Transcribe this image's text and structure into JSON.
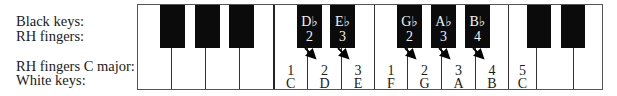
{
  "labels": {
    "black_keys": "Black keys:",
    "rh_fingers": "RH fingers:",
    "rh_fingers_c_major": "RH fingers C major:",
    "white_keys": "White keys:"
  },
  "white_keys": [
    {
      "note": "",
      "finger": ""
    },
    {
      "note": "",
      "finger": ""
    },
    {
      "note": "",
      "finger": ""
    },
    {
      "note": "",
      "finger": ""
    },
    {
      "note": "C",
      "finger": "1"
    },
    {
      "note": "D",
      "finger": "2"
    },
    {
      "note": "E",
      "finger": "3"
    },
    {
      "note": "F",
      "finger": "1"
    },
    {
      "note": "G",
      "finger": "2"
    },
    {
      "note": "A",
      "finger": "3"
    },
    {
      "note": "B",
      "finger": "4"
    },
    {
      "note": "C",
      "finger": "5"
    },
    {
      "note": "",
      "finger": ""
    },
    {
      "note": "",
      "finger": ""
    }
  ],
  "black_keys": [
    {
      "name": "",
      "finger": ""
    },
    {
      "name": "",
      "finger": ""
    },
    {
      "name": "",
      "finger": ""
    },
    {
      "name": "D♭",
      "finger": "2"
    },
    {
      "name": "E♭",
      "finger": "3"
    },
    {
      "name": "G♭",
      "finger": "2"
    },
    {
      "name": "A♭",
      "finger": "3"
    },
    {
      "name": "B♭",
      "finger": "4"
    },
    {
      "name": "",
      "finger": ""
    },
    {
      "name": "",
      "finger": ""
    }
  ],
  "colors": {
    "black_key": "#0b0b0b",
    "white_key": "#ffffff",
    "text": "#1a1a1a"
  }
}
